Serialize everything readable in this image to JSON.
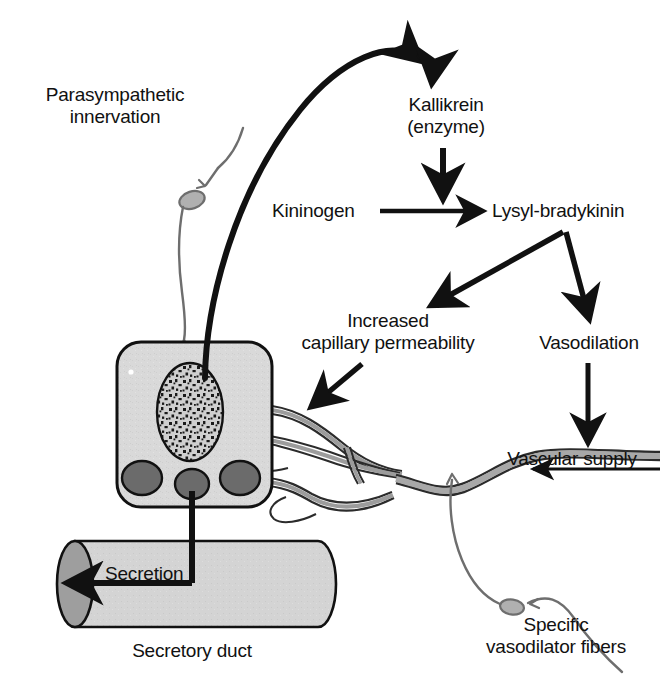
{
  "diagram": {
    "background_color": "#ffffff",
    "ink_color": "#111111",
    "cell_fill": "#d9d9d9",
    "granule_fill": "#6b6b6b",
    "vessel_fill": "#a8a8a8",
    "duct_fill": "#d2d2d2",
    "duct_cap_fill": "#9e9e9e",
    "nerve_color": "#6e6e6e",
    "labels": {
      "parasympathetic": "Parasympathetic\ninnervation",
      "kallikrein": "Kallikrein\n(enzyme)",
      "kininogen": "Kininogen",
      "lysyl_bradykinin": "Lysyl-bradykinin",
      "increased_permeability": "Increased\ncapillary permeability",
      "vasodilation": "Vasodilation",
      "vascular_supply": "Vascular supply",
      "specific_fibers": "Specific\nvasodilator fibers",
      "secretion": "Secretion",
      "secretory_duct": "Secretory duct"
    },
    "parts": {
      "acinar_cell": "acinar-cell",
      "nucleus": "cell-nucleus",
      "granules": "secretory-granules",
      "capillary_network": "capillary-network",
      "blood_vessel": "blood-vessel",
      "duct": "secretory-duct-cylinder",
      "parasympathetic_fiber": "parasympathetic-nerve-fiber",
      "vasodilator_fiber": "vasodilator-nerve-fiber"
    },
    "flow_arrows": [
      {
        "name": "cell-to-kallikrein",
        "from": "acinar-cell",
        "to": "Kallikrein (enzyme)",
        "style": "curved-thick"
      },
      {
        "name": "kallikrein-to-reaction",
        "from": "Kallikrein (enzyme)",
        "to": "Kininogen to Lysyl-bradykinin reaction",
        "style": "straight-down"
      },
      {
        "name": "kininogen-to-lysyl",
        "from": "Kininogen",
        "to": "Lysyl-bradykinin",
        "style": "straight-right"
      },
      {
        "name": "lysyl-to-permeability",
        "from": "Lysyl-bradykinin",
        "to": "Increased capillary permeability",
        "style": "diagonal-down-left"
      },
      {
        "name": "lysyl-to-vasodilation",
        "from": "Lysyl-bradykinin",
        "to": "Vasodilation",
        "style": "diagonal-down-right"
      },
      {
        "name": "permeability-to-capillary",
        "from": "Increased capillary permeability",
        "to": "capillary-network",
        "style": "diagonal-down-left"
      },
      {
        "name": "vasodilation-to-vessel",
        "from": "Vasodilation",
        "to": "blood-vessel",
        "style": "straight-down"
      },
      {
        "name": "blood-flow-direction",
        "from": "vascular supply inflow",
        "to": "gland",
        "style": "straight-left"
      },
      {
        "name": "secretion-flow",
        "from": "acinar-cell",
        "to": "duct outflow",
        "style": "elbow-left"
      }
    ]
  }
}
